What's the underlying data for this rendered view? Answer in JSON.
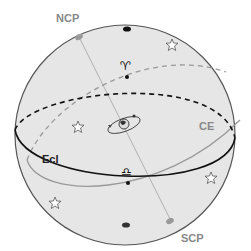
{
  "diagram": {
    "labels": {
      "ncp": "NCP",
      "scp": "SCP",
      "ce": "CE",
      "ecl": "Ecl",
      "aries": "♈",
      "libra": "♎"
    },
    "colors": {
      "sphere_fill": "#e6e6e6",
      "sphere_stroke": "#555555",
      "ecliptic": "#111111",
      "celestial_equator": "#999999",
      "label_gray": "#888888",
      "label_dark": "#222222",
      "ecliptic_pole": "#111111",
      "celestial_pole": "#999999"
    }
  }
}
